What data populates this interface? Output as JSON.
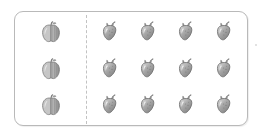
{
  "panel": {
    "type": "fruit-grouping-worksheet",
    "palette": {
      "frame_border": "#b9b9b9",
      "divider": "#c2c2c2",
      "background": "#ffffff",
      "fruit_body_light": "#d0d0d0",
      "fruit_body_mid": "#a8a8a8",
      "fruit_body_dark": "#7d7d7d",
      "fruit_outline": "#6f6f6f",
      "fruit_highlight": "#efefef",
      "stem": "#8a8a8a"
    },
    "divider_style": "dashed"
  },
  "groups": [
    {
      "id": "left-group",
      "name": "apple-group",
      "fruit": "apple",
      "columns": 1,
      "rows": 3,
      "count": 3,
      "rows_data": [
        {
          "items": [
            {
              "icon": "apple-icon",
              "label": "apple"
            }
          ]
        },
        {
          "items": [
            {
              "icon": "apple-icon",
              "label": "apple"
            }
          ]
        },
        {
          "items": [
            {
              "icon": "apple-icon",
              "label": "apple"
            }
          ]
        }
      ]
    },
    {
      "id": "right-group",
      "name": "strawberry-group",
      "fruit": "strawberry",
      "columns": 4,
      "rows": 3,
      "count": 12,
      "rows_data": [
        {
          "items": [
            {
              "icon": "strawberry-icon",
              "label": "strawberry"
            },
            {
              "icon": "strawberry-icon",
              "label": "strawberry"
            },
            {
              "icon": "strawberry-icon",
              "label": "strawberry"
            },
            {
              "icon": "strawberry-icon",
              "label": "strawberry"
            }
          ]
        },
        {
          "items": [
            {
              "icon": "strawberry-icon",
              "label": "strawberry"
            },
            {
              "icon": "strawberry-icon",
              "label": "strawberry"
            },
            {
              "icon": "strawberry-icon",
              "label": "strawberry"
            },
            {
              "icon": "strawberry-icon",
              "label": "strawberry"
            }
          ]
        },
        {
          "items": [
            {
              "icon": "strawberry-icon",
              "label": "strawberry"
            },
            {
              "icon": "strawberry-icon",
              "label": "strawberry"
            },
            {
              "icon": "strawberry-icon",
              "label": "strawberry"
            },
            {
              "icon": "strawberry-icon",
              "label": "strawberry"
            }
          ]
        }
      ]
    }
  ]
}
